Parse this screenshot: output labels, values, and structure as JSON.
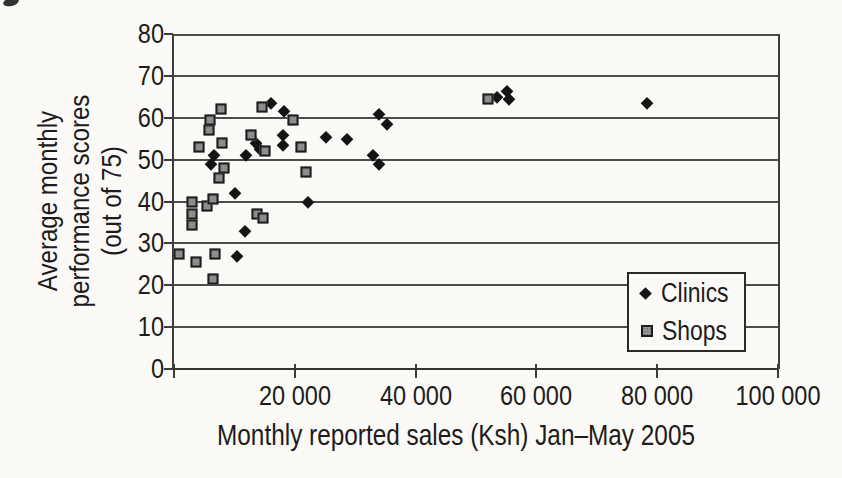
{
  "chart_data": {
    "type": "scatter",
    "title": "",
    "xlabel": "Monthly reported sales (Ksh) Jan–May 2005",
    "ylabel": "Average monthly performance scores (out of 75)",
    "ylabel_lines": [
      "Average monthly",
      "performance scores",
      "(out of 75)"
    ],
    "xlim": [
      0,
      100000
    ],
    "ylim": [
      0,
      80
    ],
    "x_ticks": [
      0,
      20000,
      40000,
      60000,
      80000,
      100000
    ],
    "x_tick_labels": {
      "20000": "20 000",
      "40000": "40 000",
      "60000": "60 000",
      "80000": "80 000",
      "100000": "100 000"
    },
    "y_ticks": [
      0,
      10,
      20,
      30,
      40,
      50,
      60,
      70,
      80
    ],
    "grid": "horizontal gridlines every 10",
    "axis_color": "#3d3d3d",
    "grid_color": "#4c4c4c",
    "text_color": "#1c1c1c",
    "legend": {
      "position": "inside-right",
      "border": true
    },
    "series": [
      {
        "name": "Clinics",
        "marker": "diamond",
        "color": "#141414",
        "points": [
          [
            6200,
            49
          ],
          [
            6700,
            51
          ],
          [
            10100,
            42
          ],
          [
            10400,
            27
          ],
          [
            11700,
            33
          ],
          [
            11900,
            51
          ],
          [
            13600,
            54
          ],
          [
            14200,
            52.5
          ],
          [
            16000,
            63.5
          ],
          [
            18100,
            56
          ],
          [
            18100,
            53.5
          ],
          [
            18200,
            61.5
          ],
          [
            22200,
            40
          ],
          [
            25100,
            55.5
          ],
          [
            28700,
            55
          ],
          [
            32900,
            51
          ],
          [
            33900,
            61
          ],
          [
            34000,
            49
          ],
          [
            35200,
            58.5
          ],
          [
            53500,
            65
          ],
          [
            55200,
            66.5
          ],
          [
            55500,
            64.5
          ],
          [
            78300,
            63.5
          ]
        ]
      },
      {
        "name": "Shops",
        "marker": "square",
        "color": "#929292",
        "points": [
          [
            900,
            27.5
          ],
          [
            2900,
            40
          ],
          [
            2900,
            37
          ],
          [
            2900,
            34.5
          ],
          [
            3700,
            25.5
          ],
          [
            4200,
            53
          ],
          [
            5500,
            39
          ],
          [
            5800,
            57
          ],
          [
            6000,
            59.5
          ],
          [
            6400,
            40.5
          ],
          [
            6400,
            21.5
          ],
          [
            6800,
            27.5
          ],
          [
            7500,
            45.5
          ],
          [
            7700,
            62
          ],
          [
            8000,
            54
          ],
          [
            8300,
            48
          ],
          [
            12700,
            56
          ],
          [
            13700,
            37
          ],
          [
            14600,
            62.5
          ],
          [
            14800,
            36
          ],
          [
            15000,
            52
          ],
          [
            19700,
            59.5
          ],
          [
            21100,
            53
          ],
          [
            21900,
            47
          ],
          [
            52000,
            64.5
          ]
        ]
      }
    ]
  }
}
